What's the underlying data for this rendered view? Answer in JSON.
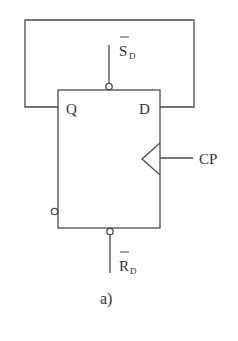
{
  "diagram": {
    "type": "D flip-flop",
    "caption": "a)",
    "pins": {
      "q": "Q",
      "d": "D",
      "set": {
        "main": "S",
        "sub": "D",
        "overbar": true
      },
      "reset": {
        "main": "R",
        "sub": "D",
        "overbar": true
      },
      "clock": "CP"
    },
    "connections": [
      "Q fed back to D"
    ],
    "colors": {
      "line": "#4a4a4a",
      "text": "#333333",
      "background": "#ffffff"
    }
  }
}
